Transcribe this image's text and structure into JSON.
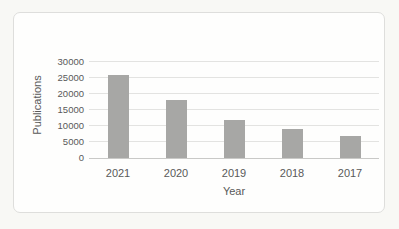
{
  "chart_data": {
    "type": "bar",
    "title": "",
    "xlabel": "Year",
    "ylabel": "Publications",
    "categories": [
      "2021",
      "2020",
      "2019",
      "2018",
      "2017"
    ],
    "values": [
      26000,
      18000,
      12000,
      9000,
      7000
    ],
    "yticks": [
      0,
      5000,
      10000,
      15000,
      20000,
      25000,
      30000
    ],
    "ylim": [
      0,
      30000
    ],
    "grid": "horizontal",
    "legend": "none",
    "bar_color": "#a7a7a5",
    "gridline_color": "#e3e3e1",
    "axis_line_color": "#c9c9c7",
    "text_color": "#595959",
    "frame_border_color": "#dededc",
    "chart_background": "#fefefd",
    "page_background": "#f8f8f5"
  }
}
